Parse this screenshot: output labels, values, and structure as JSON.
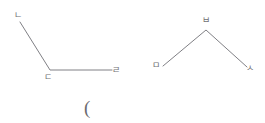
{
  "canvas": {
    "width": 265,
    "height": 123,
    "background_color": "#ffffff",
    "stroke_color": "#808085",
    "label_color": "#6f6f73",
    "stroke_width": 1
  },
  "figures": [
    {
      "name": "left-angle-figure",
      "description": "open angle opening upward-right, vertex at bottom-left",
      "points": [
        {
          "label": "ㄴ",
          "x": 20,
          "y": 22,
          "label_x": 14,
          "label_y": 11
        },
        {
          "label": "ㄷ",
          "x": 50,
          "y": 70,
          "label_x": 44,
          "label_y": 73
        },
        {
          "label": "ㄹ",
          "x": 112,
          "y": 70,
          "label_x": 112,
          "label_y": 66
        }
      ],
      "polyline": "20,22 50,70 112,70"
    },
    {
      "name": "right-angle-figure",
      "description": "inverted V with apex at top center",
      "points": [
        {
          "label": "ㅁ",
          "x": 163,
          "y": 66,
          "label_x": 152,
          "label_y": 61
        },
        {
          "label": "ㅂ",
          "x": 206,
          "y": 30,
          "label_x": 202,
          "label_y": 16
        },
        {
          "label": "ㅅ",
          "x": 247,
          "y": 67,
          "label_x": 246,
          "label_y": 64
        }
      ],
      "polyline": "163,66 206,30 247,67"
    }
  ],
  "annotations": [
    {
      "name": "open-parenthesis",
      "text": "(",
      "x": 84,
      "y": 98
    }
  ]
}
